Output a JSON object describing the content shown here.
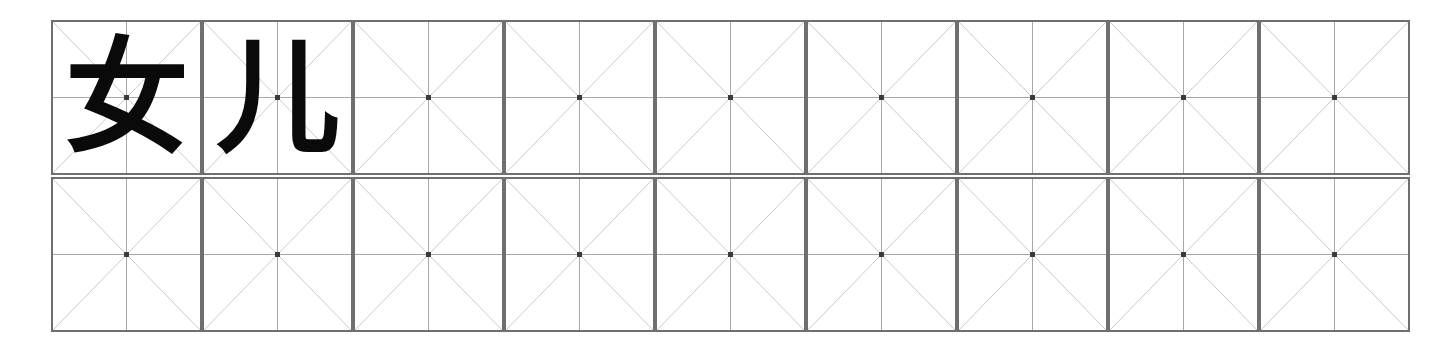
{
  "document": {
    "kind": "chinese-character-handwriting-practice-sheet",
    "word": "女儿",
    "background_color": "#ffffff"
  },
  "grid": {
    "columns": 9,
    "rows": 2,
    "origin_x": 51,
    "origin_y": 20,
    "cell_width": 151,
    "cell_height": 155,
    "cell_gap_x": 0,
    "cell_gap_y": 2,
    "style_name": "mizige",
    "border_color": "#6f6f6f",
    "border_width": 2,
    "center_line_color": "#a9a9a9",
    "diagonal_line_color": "#cacaca",
    "center_dot_color": "#3a3a3a",
    "line_width": 1
  },
  "characters": {
    "glyph_color": "#0a0a0a",
    "font_size_px": 124,
    "cells": [
      {
        "row": 0,
        "col": 0,
        "text": "女",
        "name": "character-nu"
      },
      {
        "row": 0,
        "col": 1,
        "text": "儿",
        "name": "character-er"
      },
      {
        "row": 0,
        "col": 2,
        "text": "",
        "name": "blank-practice-cell"
      },
      {
        "row": 0,
        "col": 3,
        "text": "",
        "name": "blank-practice-cell"
      },
      {
        "row": 0,
        "col": 4,
        "text": "",
        "name": "blank-practice-cell"
      },
      {
        "row": 0,
        "col": 5,
        "text": "",
        "name": "blank-practice-cell"
      },
      {
        "row": 0,
        "col": 6,
        "text": "",
        "name": "blank-practice-cell"
      },
      {
        "row": 0,
        "col": 7,
        "text": "",
        "name": "blank-practice-cell"
      },
      {
        "row": 0,
        "col": 8,
        "text": "",
        "name": "blank-practice-cell"
      },
      {
        "row": 1,
        "col": 0,
        "text": "",
        "name": "blank-practice-cell"
      },
      {
        "row": 1,
        "col": 1,
        "text": "",
        "name": "blank-practice-cell"
      },
      {
        "row": 1,
        "col": 2,
        "text": "",
        "name": "blank-practice-cell"
      },
      {
        "row": 1,
        "col": 3,
        "text": "",
        "name": "blank-practice-cell"
      },
      {
        "row": 1,
        "col": 4,
        "text": "",
        "name": "blank-practice-cell"
      },
      {
        "row": 1,
        "col": 5,
        "text": "",
        "name": "blank-practice-cell"
      },
      {
        "row": 1,
        "col": 6,
        "text": "",
        "name": "blank-practice-cell"
      },
      {
        "row": 1,
        "col": 7,
        "text": "",
        "name": "blank-practice-cell"
      },
      {
        "row": 1,
        "col": 8,
        "text": "",
        "name": "blank-practice-cell"
      }
    ]
  }
}
